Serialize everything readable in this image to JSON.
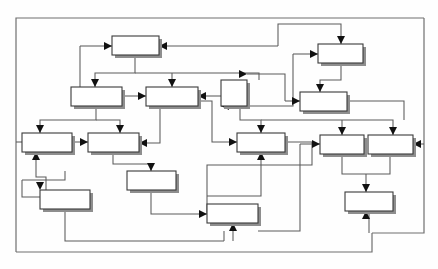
{
  "diagram": {
    "type": "block-flow-diagram",
    "canvas": {
      "width": 438,
      "height": 269,
      "background": "#ffffff"
    },
    "style": {
      "box_fill": "#ffffff",
      "box_stroke": "#3a3a3a",
      "box_shadow": "#8e8e8e",
      "edge_stroke": "#5a5a5a",
      "frame_stroke": "#6f6f6f",
      "arrow_fill": "#111111"
    },
    "frame": {
      "x": 16,
      "y": 18,
      "width": 408,
      "height": 234,
      "label": ""
    },
    "nodes": [
      {
        "id": "n1",
        "label": "",
        "x": 112,
        "y": 36,
        "w": 47,
        "h": 19
      },
      {
        "id": "n2",
        "label": "",
        "x": 318,
        "y": 44,
        "w": 45,
        "h": 19
      },
      {
        "id": "n3",
        "label": "",
        "x": 71,
        "y": 87,
        "w": 51,
        "h": 19
      },
      {
        "id": "n4",
        "label": "",
        "x": 146,
        "y": 87,
        "w": 52,
        "h": 19
      },
      {
        "id": "n5",
        "label": "",
        "x": 221,
        "y": 80,
        "w": 26,
        "h": 26
      },
      {
        "id": "n6",
        "label": "",
        "x": 300,
        "y": 92,
        "w": 47,
        "h": 19
      },
      {
        "id": "n7",
        "label": "",
        "x": 22,
        "y": 133,
        "w": 50,
        "h": 19
      },
      {
        "id": "n8",
        "label": "",
        "x": 88,
        "y": 133,
        "w": 51,
        "h": 19
      },
      {
        "id": "n9",
        "label": "",
        "x": 237,
        "y": 133,
        "w": 48,
        "h": 19
      },
      {
        "id": "n10",
        "label": "",
        "x": 320,
        "y": 135,
        "w": 44,
        "h": 19
      },
      {
        "id": "n11",
        "label": "",
        "x": 368,
        "y": 135,
        "w": 45,
        "h": 19
      },
      {
        "id": "n12",
        "label": "",
        "x": 127,
        "y": 171,
        "w": 49,
        "h": 19
      },
      {
        "id": "n13",
        "label": "",
        "x": 40,
        "y": 190,
        "w": 50,
        "h": 19
      },
      {
        "id": "n14",
        "label": "",
        "x": 345,
        "y": 192,
        "w": 48,
        "h": 19
      },
      {
        "id": "n15",
        "label": "",
        "x": 207,
        "y": 204,
        "w": 51,
        "h": 19
      }
    ],
    "edge_count": 26,
    "arrow_count": 22
  }
}
